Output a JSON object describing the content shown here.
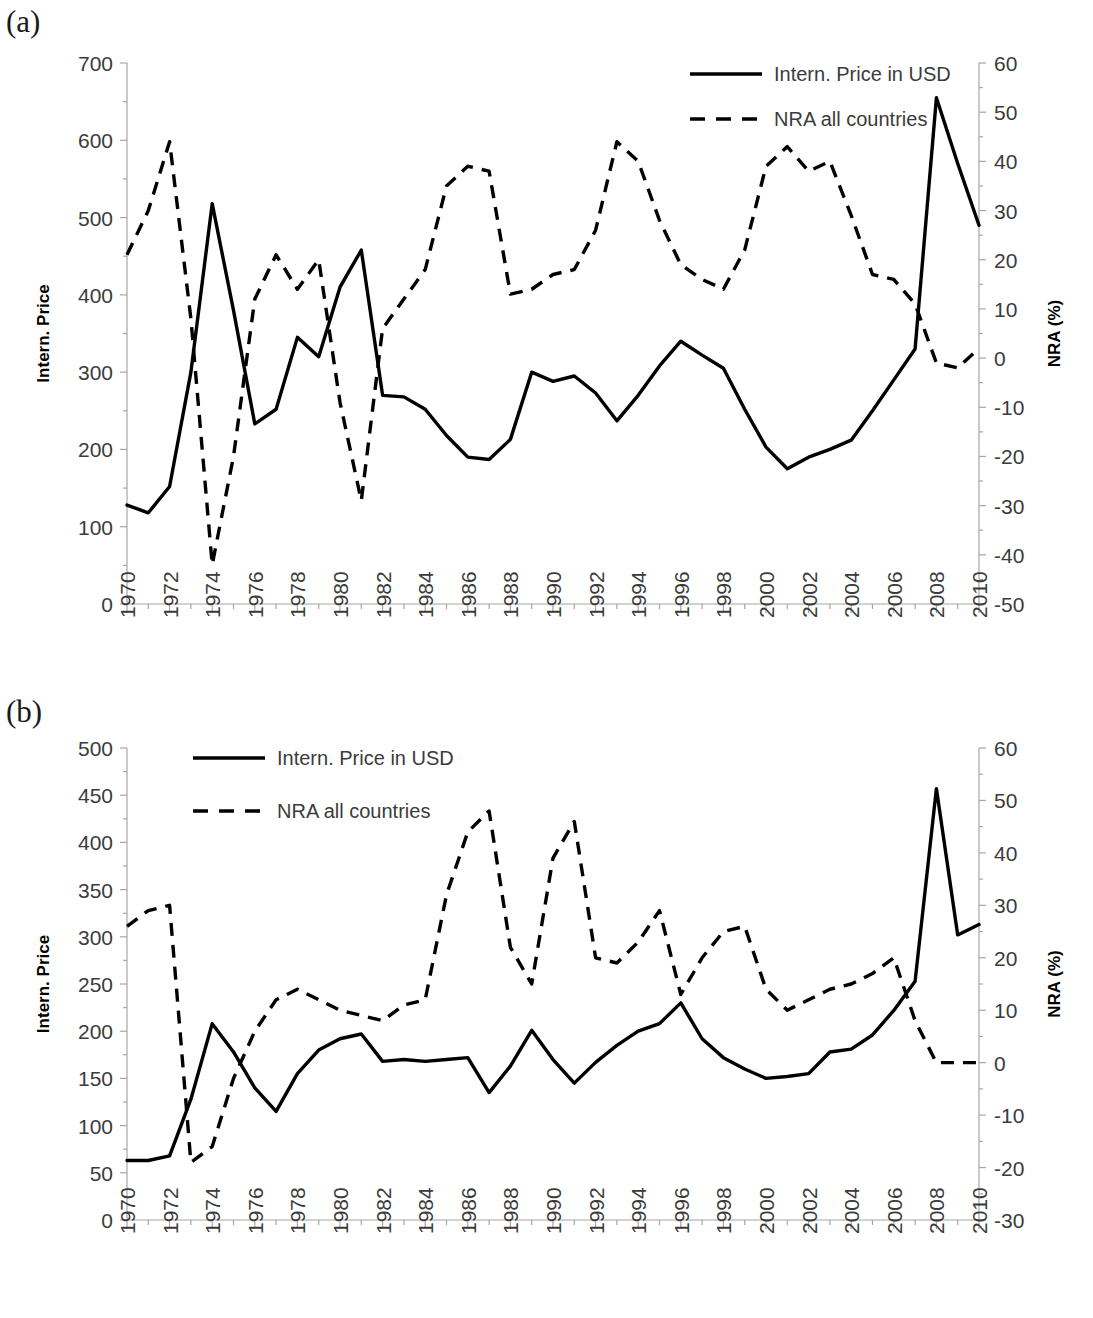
{
  "figure": {
    "panels": [
      {
        "id": "a",
        "label": "(a)",
        "legend": {
          "position": "top-right",
          "entries": [
            {
              "label": "Intern. Price in USD",
              "style": "solid"
            },
            {
              "label": "NRA all countries",
              "style": "dashed"
            }
          ]
        }
      },
      {
        "id": "b",
        "label": "(b)",
        "legend": {
          "position": "top-left",
          "entries": [
            {
              "label": "Intern. Price in USD",
              "style": "solid"
            },
            {
              "label": "NRA all countries",
              "style": "dashed"
            }
          ]
        }
      }
    ]
  },
  "chart_data": [
    {
      "type": "line",
      "panel": "(a)",
      "title": "",
      "xlabel": "",
      "ylabel": "Intern. Price",
      "y2label": "NRA (%)",
      "ylim": [
        0,
        700
      ],
      "y2lim": [
        -50,
        60
      ],
      "ytick_labels": [
        "700",
        "600",
        "500",
        "400",
        "300",
        "200",
        "100",
        "0"
      ],
      "yticks": [
        700,
        600,
        500,
        400,
        300,
        200,
        100,
        0
      ],
      "y2tick_labels": [
        "60",
        "50",
        "40",
        "30",
        "20",
        "10",
        "0",
        "-10",
        "-20",
        "-30",
        "-40",
        "-50"
      ],
      "y2ticks": [
        60,
        50,
        40,
        30,
        20,
        10,
        0,
        -10,
        -20,
        -30,
        -40,
        -50
      ],
      "xlim": [
        1970,
        2010
      ],
      "xtick_labels": [
        "1970",
        "1972",
        "1974",
        "1976",
        "1978",
        "1980",
        "1982",
        "1984",
        "1986",
        "1988",
        "1990",
        "1992",
        "1994",
        "1996",
        "1998",
        "2000",
        "2002",
        "2004",
        "2006",
        "2008",
        "2010"
      ],
      "xticks": [
        1970,
        1972,
        1974,
        1976,
        1978,
        1980,
        1982,
        1984,
        1986,
        1988,
        1990,
        1992,
        1994,
        1996,
        1998,
        2000,
        2002,
        2004,
        2006,
        2008,
        2010
      ],
      "grid": false,
      "x": [
        1970,
        1971,
        1972,
        1973,
        1974,
        1975,
        1976,
        1977,
        1978,
        1979,
        1980,
        1981,
        1982,
        1983,
        1984,
        1985,
        1986,
        1987,
        1988,
        1989,
        1990,
        1991,
        1992,
        1993,
        1994,
        1995,
        1996,
        1997,
        1998,
        1999,
        2000,
        2001,
        2002,
        2003,
        2004,
        2005,
        2006,
        2007,
        2008,
        2009,
        2010
      ],
      "series": [
        {
          "name": "Intern. Price in USD",
          "style": "solid",
          "axis": "left",
          "values": [
            128,
            118,
            152,
            300,
            518,
            380,
            233,
            252,
            345,
            320,
            410,
            458,
            270,
            268,
            252,
            218,
            190,
            187,
            213,
            300,
            288,
            295,
            273,
            237,
            270,
            308,
            340,
            322,
            305,
            252,
            203,
            175,
            190,
            200,
            212,
            250,
            290,
            330,
            655,
            570,
            490
          ]
        },
        {
          "name": "NRA all countries",
          "style": "dashed",
          "axis": "right",
          "values": [
            21,
            30,
            44,
            8,
            -42,
            -20,
            12,
            21,
            14,
            20,
            -9,
            -29,
            6,
            12,
            18,
            35,
            39,
            38,
            13,
            14,
            17,
            18,
            26,
            44,
            40,
            28,
            19,
            16,
            14,
            22,
            39,
            43,
            38,
            40,
            29,
            17,
            16,
            11,
            -1,
            -2,
            2
          ]
        }
      ]
    },
    {
      "type": "line",
      "panel": "(b)",
      "title": "",
      "xlabel": "",
      "ylabel": "Intern. Price",
      "y2label": "NRA (%)",
      "ylim": [
        0,
        500
      ],
      "y2lim": [
        -30,
        60
      ],
      "ytick_labels": [
        "500",
        "450",
        "400",
        "350",
        "300",
        "250",
        "200",
        "150",
        "100",
        "50",
        "0"
      ],
      "yticks": [
        500,
        450,
        400,
        350,
        300,
        250,
        200,
        150,
        100,
        50,
        0
      ],
      "y2tick_labels": [
        "60",
        "50",
        "40",
        "30",
        "20",
        "10",
        "0",
        "-10",
        "-20",
        "-30"
      ],
      "y2ticks": [
        60,
        50,
        40,
        30,
        20,
        10,
        0,
        -10,
        -20,
        -30
      ],
      "xlim": [
        1970,
        2010
      ],
      "xtick_labels": [
        "1970",
        "1972",
        "1974",
        "1976",
        "1978",
        "1980",
        "1982",
        "1984",
        "1986",
        "1988",
        "1990",
        "1992",
        "1994",
        "1996",
        "1998",
        "2000",
        "2002",
        "2004",
        "2006",
        "2008",
        "2010"
      ],
      "xticks": [
        1970,
        1972,
        1974,
        1976,
        1978,
        1980,
        1982,
        1984,
        1986,
        1988,
        1990,
        1992,
        1994,
        1996,
        1998,
        2000,
        2002,
        2004,
        2006,
        2008,
        2010
      ],
      "grid": false,
      "x": [
        1970,
        1971,
        1972,
        1973,
        1974,
        1975,
        1976,
        1977,
        1978,
        1979,
        1980,
        1981,
        1982,
        1983,
        1984,
        1985,
        1986,
        1987,
        1988,
        1989,
        1990,
        1991,
        1992,
        1993,
        1994,
        1995,
        1996,
        1997,
        1998,
        1999,
        2000,
        2001,
        2002,
        2003,
        2004,
        2005,
        2006,
        2007,
        2008,
        2009,
        2010
      ],
      "series": [
        {
          "name": "Intern. Price in USD",
          "style": "solid",
          "axis": "left",
          "values": [
            63,
            63,
            68,
            128,
            208,
            178,
            140,
            115,
            155,
            180,
            192,
            197,
            168,
            170,
            168,
            170,
            172,
            135,
            163,
            201,
            170,
            145,
            167,
            185,
            200,
            208,
            230,
            192,
            172,
            160,
            150,
            152,
            155,
            178,
            181,
            196,
            222,
            253,
            457,
            302,
            313
          ]
        },
        {
          "name": "NRA all countries",
          "style": "dashed",
          "axis": "right",
          "values": [
            26,
            29,
            30,
            -19,
            -16,
            -3,
            6,
            12,
            14,
            12,
            10,
            9,
            8,
            11,
            12,
            32,
            44,
            48,
            22,
            15,
            39,
            46,
            20,
            19,
            23,
            29,
            13,
            20,
            25,
            26,
            14,
            10,
            12,
            14,
            15,
            17,
            20,
            8,
            0,
            0,
            0
          ]
        }
      ]
    }
  ]
}
